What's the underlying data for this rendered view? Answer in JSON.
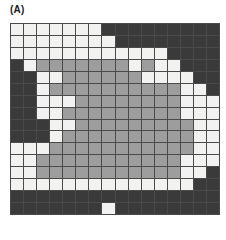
{
  "figure": {
    "panel_label": "(A)",
    "type": "categorical-grid-heatmap",
    "grid": {
      "rows": 16,
      "columns": 16,
      "legend": [
        {
          "key": "L",
          "name": "light",
          "color": "#f2f2f0"
        },
        {
          "key": "M",
          "name": "medium-gray",
          "color": "#9d9d9d"
        },
        {
          "key": "D",
          "name": "dark",
          "color": "#3a3a3a"
        }
      ],
      "cells": [
        [
          "L",
          "L",
          "L",
          "L",
          "L",
          "L",
          "L",
          "D",
          "D",
          "D",
          "D",
          "D",
          "D",
          "D",
          "D",
          "D"
        ],
        [
          "L",
          "L",
          "L",
          "L",
          "L",
          "L",
          "L",
          "L",
          "D",
          "D",
          "D",
          "D",
          "D",
          "D",
          "D",
          "D"
        ],
        [
          "L",
          "L",
          "L",
          "L",
          "L",
          "L",
          "L",
          "L",
          "L",
          "L",
          "L",
          "L",
          "D",
          "D",
          "D",
          "D"
        ],
        [
          "D",
          "L",
          "M",
          "M",
          "M",
          "M",
          "M",
          "M",
          "M",
          "L",
          "M",
          "L",
          "L",
          "D",
          "D",
          "D"
        ],
        [
          "D",
          "D",
          "L",
          "L",
          "M",
          "M",
          "M",
          "M",
          "M",
          "M",
          "L",
          "L",
          "L",
          "L",
          "D",
          "D"
        ],
        [
          "D",
          "D",
          "L",
          "M",
          "M",
          "M",
          "M",
          "M",
          "M",
          "M",
          "M",
          "M",
          "M",
          "L",
          "L",
          "D"
        ],
        [
          "D",
          "D",
          "L",
          "L",
          "L",
          "M",
          "M",
          "M",
          "M",
          "M",
          "M",
          "M",
          "M",
          "L",
          "L",
          "L"
        ],
        [
          "D",
          "D",
          "L",
          "L",
          "M",
          "M",
          "M",
          "M",
          "M",
          "M",
          "M",
          "M",
          "M",
          "L",
          "L",
          "L"
        ],
        [
          "D",
          "D",
          "D",
          "L",
          "L",
          "M",
          "M",
          "M",
          "M",
          "M",
          "M",
          "M",
          "M",
          "M",
          "L",
          "L"
        ],
        [
          "D",
          "D",
          "D",
          "L",
          "M",
          "M",
          "M",
          "M",
          "M",
          "M",
          "M",
          "M",
          "M",
          "M",
          "L",
          "L"
        ],
        [
          "L",
          "L",
          "L",
          "M",
          "M",
          "M",
          "M",
          "M",
          "M",
          "M",
          "M",
          "M",
          "M",
          "M",
          "L",
          "L"
        ],
        [
          "L",
          "L",
          "M",
          "M",
          "M",
          "M",
          "M",
          "M",
          "M",
          "M",
          "M",
          "M",
          "M",
          "L",
          "L",
          "L"
        ],
        [
          "L",
          "L",
          "M",
          "M",
          "M",
          "M",
          "M",
          "M",
          "M",
          "M",
          "M",
          "M",
          "M",
          "L",
          "L",
          "D"
        ],
        [
          "L",
          "L",
          "L",
          "L",
          "L",
          "L",
          "L",
          "L",
          "L",
          "L",
          "L",
          "L",
          "L",
          "L",
          "D",
          "D"
        ],
        [
          "D",
          "D",
          "D",
          "D",
          "D",
          "D",
          "D",
          "D",
          "D",
          "D",
          "D",
          "D",
          "D",
          "D",
          "D",
          "D"
        ],
        [
          "D",
          "D",
          "D",
          "D",
          "D",
          "D",
          "D",
          "L",
          "D",
          "D",
          "D",
          "D",
          "D",
          "D",
          "D",
          "D"
        ]
      ]
    }
  }
}
